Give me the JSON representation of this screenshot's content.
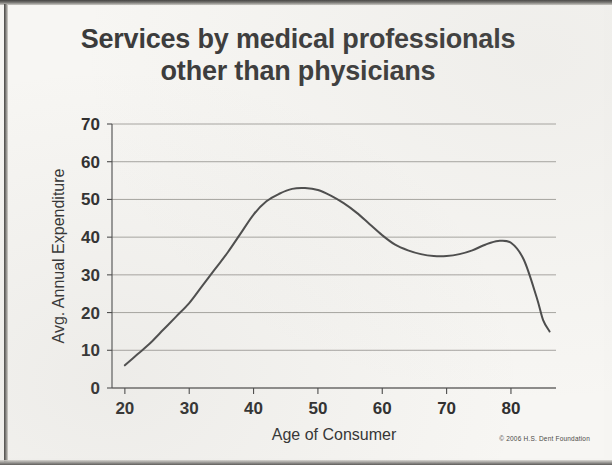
{
  "title": {
    "line1": "Services by medical professionals",
    "line2": "other than physicians"
  },
  "copyright": "© 2006 H.S. Dent Foundation",
  "colors": {
    "background": "#f7f6f3",
    "title_text": "#3b3b3b",
    "curve": "#4b4b4b",
    "gridline": "#8e8c88",
    "axis": "#4a4a4a"
  },
  "chart_data": {
    "type": "line",
    "title": "Services by medical professionals other than physicians",
    "xlabel": "Age of Consumer",
    "ylabel": "Avg. Annual Expenditure",
    "xlim": [
      18,
      87
    ],
    "ylim": [
      0,
      70
    ],
    "xticks": [
      20,
      30,
      40,
      50,
      60,
      70,
      80
    ],
    "yticks": [
      0,
      10,
      20,
      30,
      40,
      50,
      60,
      70
    ],
    "xtick_labels": [
      "20",
      "30",
      "40",
      "50",
      "60",
      "70",
      "80"
    ],
    "ytick_labels": [
      "0",
      "10",
      "20",
      "30",
      "40",
      "50",
      "60",
      "70"
    ],
    "grid": true,
    "legend": false,
    "series": [
      {
        "name": "Avg. Annual Expenditure",
        "x": [
          20,
          22,
          24,
          26,
          28,
          30,
          32,
          34,
          36,
          38,
          40,
          42,
          44,
          46,
          48,
          50,
          52,
          54,
          56,
          58,
          60,
          62,
          64,
          66,
          68,
          70,
          72,
          74,
          76,
          78,
          80,
          82,
          84,
          85,
          86
        ],
        "values": [
          6,
          9,
          12,
          15.5,
          19,
          22.5,
          27,
          31.5,
          36,
          41,
          46,
          49.5,
          51.5,
          52.8,
          53,
          52.5,
          51,
          49,
          46.5,
          43.5,
          40.5,
          38,
          36.5,
          35.5,
          35,
          35,
          35.5,
          36.5,
          38,
          39,
          38.5,
          34,
          24,
          18,
          15
        ]
      }
    ]
  }
}
